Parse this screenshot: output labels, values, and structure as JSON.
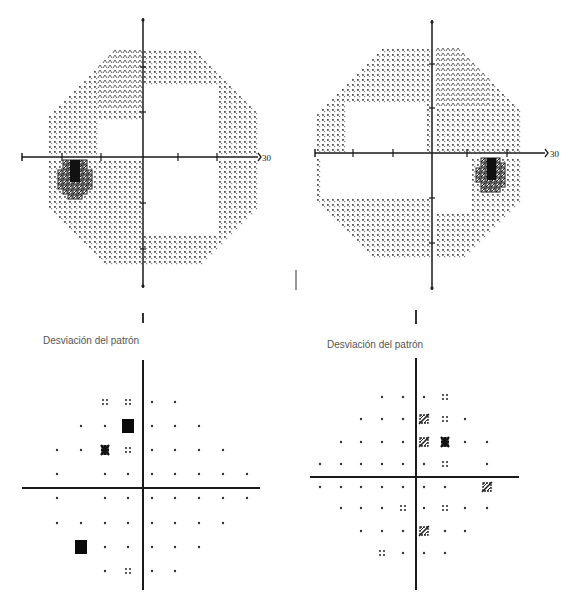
{
  "figure": {
    "panels": [
      {
        "id": "left-grayscale",
        "type": "grayscale-field",
        "eye": "left",
        "axis": {
          "cx": 143,
          "cy": 157,
          "x0": 22,
          "x1": 258,
          "y0": 18,
          "y1": 288,
          "xticks": [
            62,
            101,
            178,
            217
          ],
          "yticks": [
            67,
            112,
            203,
            249
          ]
        },
        "scale_label": "30",
        "scale_label_pos": {
          "x": 262,
          "y": 161
        },
        "field": {
          "x0": 50,
          "x1": 257,
          "y0": 52,
          "y1": 263,
          "step": 5,
          "cut_top": 62,
          "cut_bot": 55
        },
        "scotoma": {
          "cx": 75,
          "cy": 178,
          "rx": 17,
          "ry": 20
        },
        "scotoma_core": {
          "x": 70,
          "y": 160,
          "w": 10,
          "h": 22
        },
        "dense_regions": [
          {
            "x0": 100,
            "x1": 140,
            "y0": 52,
            "y1": 108
          }
        ],
        "sparse_regions": [
          {
            "x0": 100,
            "x1": 143,
            "y0": 120,
            "y1": 157
          },
          {
            "x0": 143,
            "x1": 215,
            "y0": 85,
            "y1": 235
          }
        ]
      },
      {
        "id": "right-grayscale",
        "type": "grayscale-field",
        "eye": "right",
        "axis": {
          "cx": 432,
          "cy": 153,
          "x0": 315,
          "x1": 545,
          "y0": 20,
          "y1": 290,
          "xticks": [
            353,
            393,
            467,
            507
          ],
          "yticks": [
            64,
            108,
            198,
            243
          ]
        },
        "scale_label": "30",
        "scale_label_pos": {
          "x": 550,
          "y": 157
        },
        "field": {
          "x0": 318,
          "x1": 522,
          "y0": 50,
          "y1": 255,
          "step": 5,
          "cut_top": 62,
          "cut_bot": 55
        },
        "scotoma": {
          "cx": 492,
          "cy": 175,
          "rx": 16,
          "ry": 20
        },
        "scotoma_core": {
          "x": 487,
          "y": 158,
          "w": 9,
          "h": 22
        },
        "dense_regions": [
          {
            "x0": 435,
            "x1": 490,
            "y0": 50,
            "y1": 105
          }
        ],
        "sparse_regions": [
          {
            "x0": 345,
            "x1": 425,
            "y0": 105,
            "y1": 150
          },
          {
            "x0": 320,
            "x1": 432,
            "y0": 158,
            "y1": 195
          },
          {
            "x0": 436,
            "x1": 470,
            "y0": 155,
            "y1": 210
          }
        ]
      }
    ],
    "pattern_deviation": [
      {
        "id": "left-pattern-deviation",
        "title": "Desviación del patrón",
        "title_pos": {
          "x": 43,
          "y": 335
        },
        "axis": {
          "cx": 143,
          "cy": 488,
          "x0": 22,
          "x1": 260,
          "y0": 360,
          "y1": 590
        },
        "cols": [
          57,
          81,
          105,
          128,
          152,
          175,
          199,
          223,
          247
        ],
        "rows": [
          402,
          426,
          450,
          474,
          498,
          523,
          547,
          571
        ],
        "grid": [
          [
            "",
            "",
            "p2",
            "p2",
            "p1",
            "p1",
            "",
            "",
            ""
          ],
          [
            "",
            "p1",
            "p1",
            "p5",
            "p1",
            "p1",
            "p1",
            "",
            ""
          ],
          [
            "p1",
            "p1",
            "p4",
            "p2",
            "p1",
            "p1",
            "p1",
            "p1",
            ""
          ],
          [
            "p1",
            "",
            "p1",
            "p1",
            "p1",
            "p1",
            "p1",
            "p1",
            "p1"
          ],
          [
            "p1",
            "",
            "p1",
            "p1",
            "p1",
            "p1",
            "p1",
            "p1",
            "p1"
          ],
          [
            "p1",
            "p1",
            "p1",
            "p1",
            "p1",
            "p1",
            "p1",
            "p1",
            ""
          ],
          [
            "",
            "p5",
            "p1",
            "p1",
            "p1",
            "p1",
            "p1",
            "",
            ""
          ],
          [
            "",
            "",
            "p1",
            "p2",
            "p1",
            "p1",
            "",
            "",
            ""
          ]
        ]
      },
      {
        "id": "right-pattern-deviation",
        "title": "Desviación del patrón",
        "title_pos": {
          "x": 327,
          "y": 339
        },
        "axis": {
          "cx": 416,
          "cy": 477,
          "x0": 310,
          "x1": 519,
          "y0": 358,
          "y1": 590
        },
        "cols": [
          320,
          341,
          361,
          382,
          403,
          424,
          445,
          465,
          487
        ],
        "rows": [
          397,
          419,
          442,
          464,
          487,
          508,
          531,
          553
        ],
        "grid": [
          [
            "",
            "",
            "",
            "p1",
            "p1",
            "p1",
            "p2",
            "",
            ""
          ],
          [
            "",
            "",
            "p1",
            "p1",
            "p1",
            "p3",
            "p2",
            "p1",
            ""
          ],
          [
            "",
            "p1",
            "p1",
            "p1",
            "p1",
            "p3",
            "p4",
            "p1",
            "p1"
          ],
          [
            "p1",
            "p1",
            "p1",
            "p1",
            "p1",
            "p1",
            "p2",
            "",
            "p1"
          ],
          [
            "p1",
            "p1",
            "p1",
            "p1",
            "p1",
            "p1",
            "p1",
            "",
            "p3"
          ],
          [
            "",
            "p1",
            "p1",
            "p1",
            "p2",
            "p1",
            "p2",
            "p1",
            "p1"
          ],
          [
            "",
            "",
            "p1",
            "p1",
            "p1",
            "p3",
            "p1",
            "p1",
            ""
          ],
          [
            "",
            "",
            "",
            "p2",
            "p1",
            "p1",
            "p1",
            "",
            ""
          ]
        ]
      }
    ],
    "stray_marks": [
      {
        "x": 143,
        "y": 313,
        "h": 10,
        "w": 2
      },
      {
        "x": 416,
        "y": 310,
        "h": 14,
        "w": 2
      },
      {
        "x": 296,
        "y": 270,
        "h": 20,
        "w": 1
      }
    ],
    "symbol_legend": {
      "p1": "single-dot (normal)",
      "p2": "four-dot (p<5%)",
      "p3": "slashed-cluster (p<2%)",
      "p4": "dense-cluster (p<1%)",
      "p5": "solid-square (p<0.5%)"
    },
    "caption": "Figura 10.10 Defectos en el campo visual..."
  },
  "colors": {
    "ink": "#1a1a1a",
    "dot": "#555555",
    "title": "#555555"
  }
}
